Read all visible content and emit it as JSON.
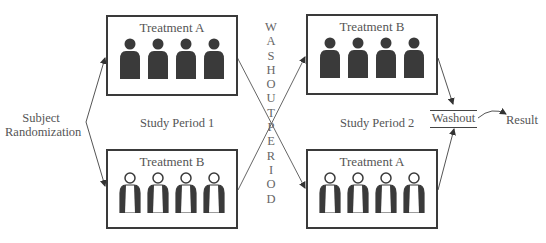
{
  "diagram": {
    "type": "crossover study design",
    "randomization_label": [
      "Subject",
      "Randomization"
    ],
    "period_labels": [
      "Study Period 1",
      "Study Period 2"
    ],
    "washout_vertical": [
      "W",
      "A",
      "S",
      "H",
      "O",
      "U",
      "T",
      "P",
      "E",
      "R",
      "I",
      "O",
      "D"
    ],
    "washout_vertical_text": "WASHOUT PERIOD",
    "washout_box_label": "Washout",
    "result_label": "Result",
    "boxes": [
      {
        "id": "p1-top",
        "title": "Treatment A",
        "figure_style": "solid",
        "count": 4
      },
      {
        "id": "p1-bottom",
        "title": "Treatment B",
        "figure_style": "outline",
        "count": 4
      },
      {
        "id": "p2-top",
        "title": "Treatment B",
        "figure_style": "solid",
        "count": 4
      },
      {
        "id": "p2-bottom",
        "title": "Treatment A",
        "figure_style": "outline",
        "count": 4
      }
    ],
    "colors": {
      "line": "#444444",
      "figure_solid": "#3a3a3a",
      "text": "#555555",
      "background": "#ffffff"
    }
  }
}
